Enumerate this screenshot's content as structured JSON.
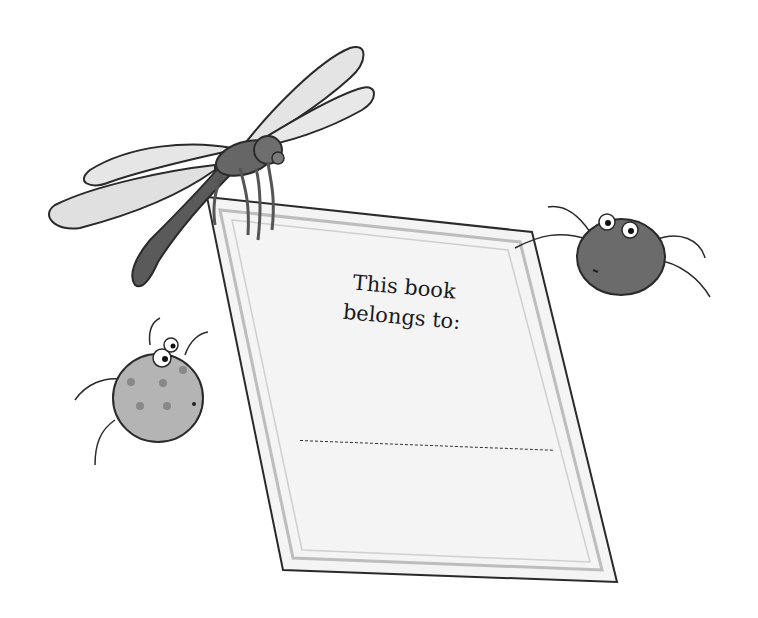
{
  "illustration": {
    "subject": "bookplate held by a dragonfly with two bugs",
    "colors": {
      "background": "#ffffff",
      "plate_fill": "#f2f2f2",
      "plate_border": "#bdbdbd",
      "outline": "#2a2a2a",
      "dragonfly_body": "#5a5a5a",
      "wing_fill": "#e2e2e2",
      "dark_bug": "#6b6b6b",
      "light_bug": "#b4b4b4"
    }
  },
  "bookplate": {
    "line1": "This book",
    "line2": "belongs to:",
    "owner_value": ""
  }
}
